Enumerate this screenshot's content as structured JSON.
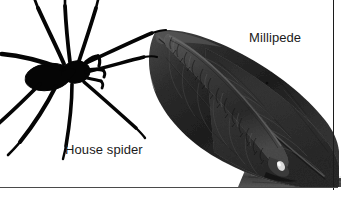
{
  "figure": {
    "kind": "photo-illustration",
    "background_color": "#ffffff",
    "width": 341,
    "height": 198,
    "border_color": "#1c1c1c",
    "subjects": [
      {
        "name": "house-spider",
        "label": "House spider",
        "rendering": "black silhouette",
        "color": "#050505",
        "leg_count": 8,
        "position": "left"
      },
      {
        "name": "millipede",
        "label": "Millipede",
        "rendering": "grayscale photograph on dead leaf",
        "color": "#2b2b2b",
        "position": "right"
      }
    ]
  },
  "labels": {
    "millipede": "Millipede",
    "house_spider": "House spider"
  }
}
